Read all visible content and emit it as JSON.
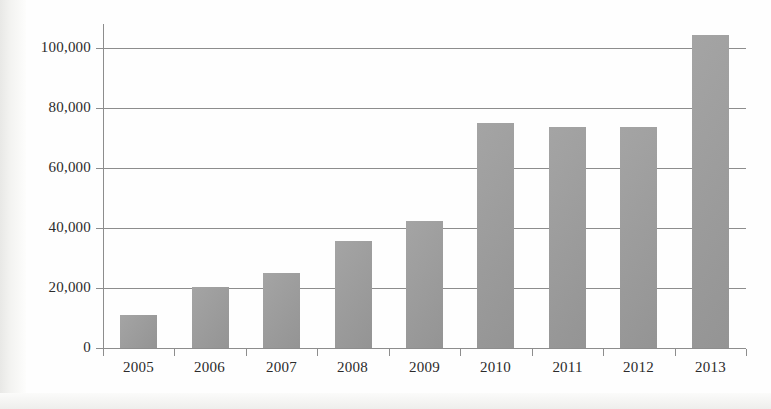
{
  "chart_data": {
    "type": "bar",
    "title": "",
    "subtitle": "",
    "xlabel": "",
    "ylabel": "",
    "categories": [
      "2005",
      "2006",
      "2007",
      "2008",
      "2009",
      "2010",
      "2011",
      "2012",
      "2013"
    ],
    "values": [
      11000,
      20200,
      25000,
      35700,
      42300,
      75000,
      73700,
      73800,
      104300
    ],
    "ylim": [
      0,
      110000
    ],
    "ytick_values": [
      0,
      20000,
      40000,
      60000,
      80000,
      100000
    ],
    "ytick_labels": [
      "0",
      "20,000",
      "40,000",
      "60,000",
      "80,000",
      "100,000"
    ],
    "grid": true,
    "grid_axis": "y",
    "legend": false,
    "legend_position": "none",
    "series": [
      {
        "name": "",
        "values": [
          11000,
          20200,
          25000,
          35700,
          42300,
          75000,
          73700,
          73800,
          104300
        ]
      }
    ]
  },
  "style": {
    "bar_color": "#9a9a9a",
    "axis_color": "#8d8d8d",
    "grid_color": "#8d8d8d",
    "text_color": "#2b2b2b",
    "background": "#fefefe"
  },
  "artifacts": {
    "bleed_text_a": " ",
    "bleed_text_b": " "
  }
}
